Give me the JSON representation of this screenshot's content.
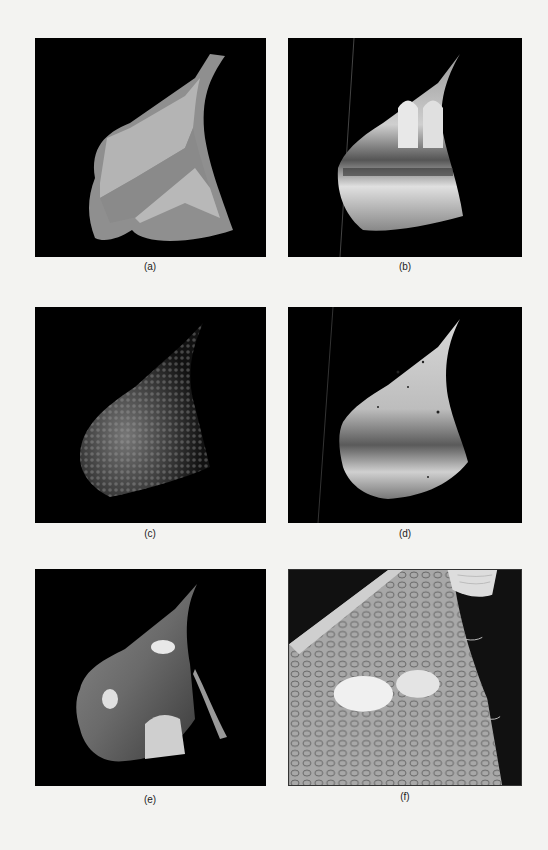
{
  "figure": {
    "background_color": "#f3f3f1",
    "panels": [
      {
        "id": "a",
        "label": "(a)",
        "description": "Flat-shaded 3D surface patch (leaf/sail shape) with two diagonal grey bands"
      },
      {
        "id": "b",
        "label": "(b)",
        "description": "Surface patch texture-mapped with an interior architectural scene (arched hall)"
      },
      {
        "id": "c",
        "label": "(c)",
        "description": "Surface patch rendered with bumpy droplet-like normal texture, dimly lit"
      },
      {
        "id": "d",
        "label": "(d)",
        "description": "Surface patch rendered with bump texture and speckled bright shading"
      },
      {
        "id": "e",
        "label": "(e)",
        "description": "Combined rendering with droplets, bright highlights and a separated curled edge"
      },
      {
        "id": "f",
        "label": "(f)",
        "description": "Close-up detail of droplet texture with bright highlight blob"
      }
    ]
  }
}
